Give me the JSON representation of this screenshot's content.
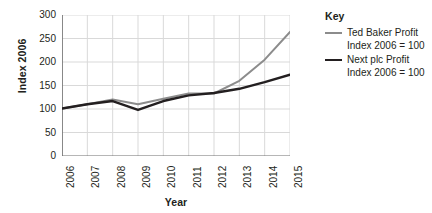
{
  "chart_data": {
    "type": "line",
    "title": "",
    "xlabel": "Year",
    "ylabel": "Index 2006",
    "x": [
      2006,
      2007,
      2008,
      2009,
      2010,
      2011,
      2012,
      2013,
      2014,
      2015
    ],
    "xtick_labels": [
      "2006",
      "2007",
      "2008",
      "2009",
      "2010",
      "2011",
      "2012",
      "2013",
      "2014",
      "2015"
    ],
    "ytick_labels": [
      "0",
      "50",
      "100",
      "150",
      "200",
      "250",
      "300"
    ],
    "ytick_values": [
      0,
      50,
      100,
      150,
      200,
      250,
      300
    ],
    "ylim": [
      0,
      300
    ],
    "grid": true,
    "legend_position": "right",
    "series": [
      {
        "name": "Ted Baker Profit",
        "sublabel": "Index 2006 = 100",
        "color": "#8c8c8c",
        "width": 2.0,
        "values": [
          101,
          110,
          120,
          110,
          122,
          133,
          133,
          160,
          205,
          264
        ]
      },
      {
        "name": "Next plc Profit",
        "sublabel": "Index 2006 = 100",
        "color": "#231f20",
        "width": 2.4,
        "values": [
          101,
          110,
          117,
          98,
          117,
          129,
          134,
          143,
          157,
          173
        ]
      }
    ]
  },
  "legend": {
    "title": "Key"
  },
  "colors": {
    "axis": "#6f6f6f",
    "grid": "#d9d9d9",
    "text": "#231f20",
    "background": "#ffffff"
  }
}
